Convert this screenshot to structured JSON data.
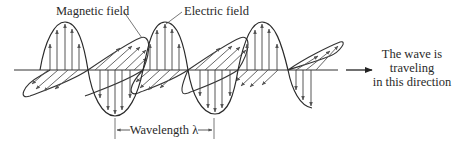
{
  "figure": {
    "labels": {
      "magnetic": "Magnetic field",
      "electric": "Electric field",
      "wavelength": "Wavelength λ",
      "direction_line1": "The wave is",
      "direction_line2": "traveling",
      "direction_line3": "in this direction"
    },
    "colors": {
      "stroke": "#2a2a2a",
      "arrow": "#555555",
      "background": "#ffffff"
    }
  }
}
